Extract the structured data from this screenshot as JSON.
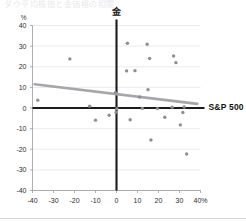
{
  "page": {
    "cut_title": "ダウ平均株価と金価格の相関"
  },
  "chart_data": {
    "type": "scatter",
    "title": "",
    "xlabel": "S&P 500",
    "ylabel": "金",
    "unit_label": "%",
    "x_unit_suffix": "%",
    "xlim": [
      -40,
      40
    ],
    "ylim": [
      -40,
      40
    ],
    "xticks": [
      -40,
      -30,
      -20,
      -10,
      0,
      10,
      20,
      30,
      40
    ],
    "xtick_labels": [
      "-40",
      "-30",
      "-20",
      "-10",
      "0",
      "10",
      "20",
      "30",
      "40%"
    ],
    "yticks": [
      40,
      30,
      20,
      10,
      0,
      -10,
      -20,
      -30,
      -40
    ],
    "ytick_labels": [
      "40",
      "30",
      "20",
      "10",
      "0",
      "-10",
      "-20",
      "-30",
      "-40"
    ],
    "grid": true,
    "legend": "none",
    "point_color": "#8e8e93",
    "trend_color": "#a6a6aa",
    "axis_color": "#1b1b1b",
    "points": [
      {
        "x": -37.5,
        "y": 3.8
      },
      {
        "x": -22.2,
        "y": 23.8
      },
      {
        "x": -12.8,
        "y": 0.9
      },
      {
        "x": -10.0,
        "y": -5.9
      },
      {
        "x": -3.5,
        "y": -3.5
      },
      {
        "x": -0.5,
        "y": 7.4
      },
      {
        "x": -0.2,
        "y": -2.0
      },
      {
        "x": 0.2,
        "y": -0.3
      },
      {
        "x": 5.2,
        "y": 31.4
      },
      {
        "x": 4.8,
        "y": 18.0
      },
      {
        "x": 6.5,
        "y": -5.7
      },
      {
        "x": 8.8,
        "y": 18.1
      },
      {
        "x": 11.0,
        "y": 5.3
      },
      {
        "x": 12.3,
        "y": -0.2
      },
      {
        "x": 14.6,
        "y": 30.9
      },
      {
        "x": 15.8,
        "y": 24.0
      },
      {
        "x": 15.0,
        "y": 8.9
      },
      {
        "x": 16.4,
        "y": -15.5
      },
      {
        "x": 19.5,
        "y": -0.3
      },
      {
        "x": 23.0,
        "y": -4.5
      },
      {
        "x": 27.2,
        "y": 25.2
      },
      {
        "x": 28.3,
        "y": 22.0
      },
      {
        "x": 26.5,
        "y": 0.4
      },
      {
        "x": 30.4,
        "y": -8.2
      },
      {
        "x": 31.6,
        "y": -2.2
      },
      {
        "x": 32.2,
        "y": 0.5
      },
      {
        "x": 33.4,
        "y": -22.3
      }
    ],
    "trend_line": {
      "x0": -39.0,
      "y0": 11.5,
      "x1": 38.5,
      "y1": 2.0
    }
  }
}
